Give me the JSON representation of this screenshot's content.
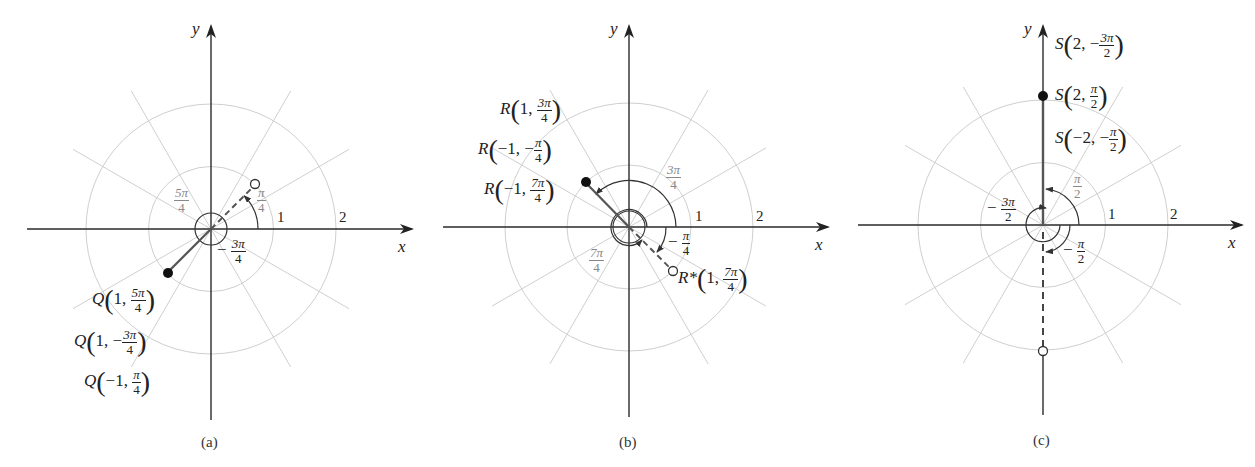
{
  "panels": [
    {
      "id": "a",
      "caption": "(a)",
      "origin": [
        211,
        229
      ],
      "unit": 62.5,
      "axis_labels": {
        "x": "x",
        "y": "y"
      },
      "ring_labels": [
        "1",
        "2"
      ],
      "angle_labels": [
        {
          "text_num": "π",
          "text_den": "4",
          "sign": "",
          "tone": "gray"
        },
        {
          "text_num": "5π",
          "text_den": "4",
          "sign": "",
          "tone": "gray"
        },
        {
          "text_num": "3π",
          "text_den": "4",
          "sign": "−",
          "tone": "dark"
        }
      ],
      "points": [
        {
          "label": "Q",
          "args": [
            {
              "pre": "1, ",
              "num": "5π",
              "den": "4"
            }
          ]
        },
        {
          "label": "Q",
          "args": [
            {
              "pre": "1, −",
              "num": "3π",
              "den": "4"
            }
          ]
        },
        {
          "label": "Q",
          "args": [
            {
              "pre": "−1, ",
              "num": "π",
              "den": "4"
            }
          ]
        }
      ]
    },
    {
      "id": "b",
      "caption": "(b)",
      "origin": [
        629,
        227
      ],
      "unit": 62,
      "axis_labels": {
        "x": "x",
        "y": "y"
      },
      "ring_labels": [
        "1",
        "2"
      ],
      "angle_labels": [
        {
          "text_num": "3π",
          "text_den": "4",
          "sign": "",
          "tone": "gray"
        },
        {
          "text_num": "7π",
          "text_den": "4",
          "sign": "",
          "tone": "gray"
        },
        {
          "text_num": "π",
          "text_den": "4",
          "sign": "−",
          "tone": "dark"
        }
      ],
      "points": [
        {
          "label": "R",
          "args": [
            {
              "pre": "1, ",
              "num": "3π",
              "den": "4"
            }
          ]
        },
        {
          "label": "R",
          "args": [
            {
              "pre": "−1, −",
              "num": "π",
              "den": "4"
            }
          ]
        },
        {
          "label": "R",
          "args": [
            {
              "pre": "−1, ",
              "num": "7π",
              "den": "4"
            }
          ]
        },
        {
          "label": "R*",
          "args": [
            {
              "pre": "1, ",
              "num": "7π",
              "den": "4"
            }
          ]
        }
      ]
    },
    {
      "id": "c",
      "caption": "(c)",
      "origin": [
        1043,
        225
      ],
      "unit": 62.5,
      "axis_labels": {
        "x": "x",
        "y": "y"
      },
      "ring_labels": [
        "1",
        "2"
      ],
      "angle_labels": [
        {
          "text_num": "π",
          "text_den": "2",
          "sign": "",
          "tone": "gray"
        },
        {
          "text_num": "3π",
          "text_den": "2",
          "sign": "−",
          "tone": "dark"
        },
        {
          "text_num": "π",
          "text_den": "2",
          "sign": "−",
          "tone": "dark"
        }
      ],
      "points": [
        {
          "label": "S",
          "args": [
            {
              "pre": "2, −",
              "num": "3π",
              "den": "2"
            }
          ]
        },
        {
          "label": "S",
          "args": [
            {
              "pre": "2, ",
              "num": "π",
              "den": "2"
            }
          ]
        },
        {
          "label": "S",
          "args": [
            {
              "pre": "−2, −",
              "num": "π",
              "den": "2"
            }
          ]
        }
      ]
    }
  ],
  "colors": {
    "axis": "#2a2a2a",
    "grid": "#c8c8c8",
    "vector": "#555555",
    "arc": "#333333"
  }
}
